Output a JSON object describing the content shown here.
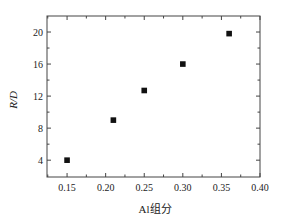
{
  "chart_data": {
    "type": "scatter",
    "title": "",
    "xlabel": "Al组分",
    "ylabel": "R/D",
    "xlim": [
      0.124,
      0.4
    ],
    "ylim": [
      1.9,
      22
    ],
    "xticks": [
      0.15,
      0.2,
      0.25,
      0.3,
      0.35,
      0.4
    ],
    "xtick_labels": [
      "0.15",
      "0.20",
      "0.25",
      "0.30",
      "0.35",
      "0.40"
    ],
    "yticks": [
      4,
      8,
      12,
      16,
      20
    ],
    "ytick_labels": [
      "4",
      "8",
      "12",
      "16",
      "20"
    ],
    "grid": false,
    "legend": null,
    "series": [
      {
        "name": "R/D",
        "marker": "square",
        "color": "#000000",
        "x": [
          0.15,
          0.21,
          0.25,
          0.3,
          0.36
        ],
        "y": [
          4.0,
          9.0,
          12.7,
          16.0,
          19.8
        ]
      }
    ]
  },
  "style": {
    "axis_color": "#444444",
    "marker_color": "#111111",
    "background": "#ffffff"
  }
}
